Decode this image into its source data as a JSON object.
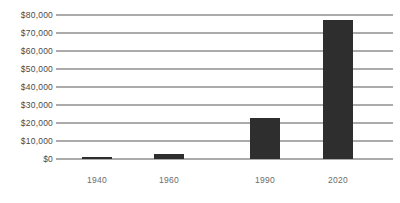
{
  "chart_data": {
    "type": "bar",
    "title": "",
    "subtitle": "",
    "xlabel": "",
    "ylabel": "",
    "categories": [
      "1940",
      "1960",
      "1990",
      "2020"
    ],
    "values": [
      1200,
      3000,
      23000,
      77500
    ],
    "series": [
      {
        "name": "",
        "values": [
          1200,
          3000,
          23000,
          77500
        ]
      }
    ],
    "ylim": [
      0,
      80000
    ],
    "yticks": [
      0,
      10000,
      20000,
      30000,
      40000,
      50000,
      60000,
      70000,
      80000
    ],
    "ytick_labels": [
      "$0",
      "$10,000",
      "$20,000",
      "$30,000",
      "$40,000",
      "$50,000",
      "$60,000",
      "$70,000",
      "$80,000"
    ],
    "xtick_labels": [
      "1940",
      "1960",
      "1990",
      "2020"
    ],
    "grid": true,
    "grid_axis": "y",
    "legend": false,
    "legend_entries": [],
    "annotations": [],
    "colors": {
      "bar": "#2e2e2e",
      "gridline": "#58585a",
      "ytick_text": "#4a4a4a",
      "xtick_text": "#6b6b6b",
      "background": "#ffffff"
    }
  }
}
